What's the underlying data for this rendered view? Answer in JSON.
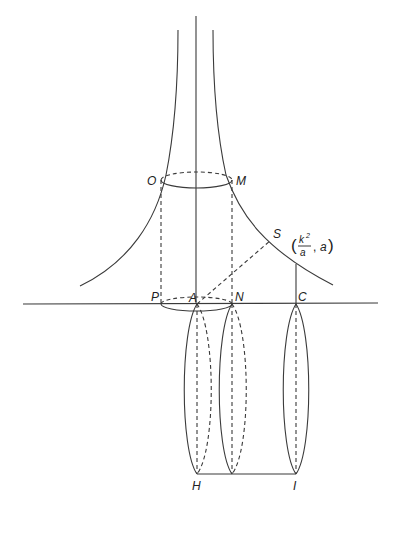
{
  "figure": {
    "labels": {
      "O": "O",
      "M": "M",
      "S": "S",
      "P": "P",
      "A": "A",
      "N": "N",
      "C": "C",
      "H": "H",
      "I": "I"
    },
    "point_annotation": {
      "numerator": "k",
      "exponent": "2",
      "denominator": "a",
      "second": "a"
    },
    "colors": {
      "stroke": "#3a3a3a",
      "background": "#ffffff"
    }
  }
}
